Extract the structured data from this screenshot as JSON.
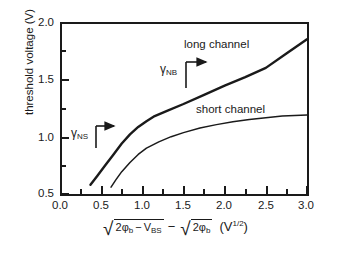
{
  "chart_data": {
    "type": "line",
    "title": "",
    "xlabel": "sqrt(2*phi_b - V_BS) - sqrt(2*phi_b)  (V^1/2)",
    "ylabel": "threshold voltage (V)",
    "xlim": [
      0.0,
      3.0
    ],
    "ylim": [
      0.5,
      2.0
    ],
    "x_major_step": 0.5,
    "x_minor_step": 0.25,
    "y_major_step": 0.5,
    "y_minor_step": 0.25,
    "grid": false,
    "legend": "inline-curve-labels",
    "x_ticklabels": [
      "0.0",
      "0.5",
      "1.0",
      "1.5",
      "2.0",
      "2.5",
      "3.0"
    ],
    "y_ticklabels": [
      "0.5",
      "1.0",
      "1.5",
      "2.0"
    ],
    "series": [
      {
        "name": "long channel",
        "x": [
          0.37,
          0.45,
          0.55,
          0.65,
          0.75,
          0.85,
          0.95,
          1.05,
          1.15,
          1.3,
          1.5,
          1.75,
          2.0,
          2.25,
          2.5,
          2.75,
          3.0
        ],
        "values": [
          0.58,
          0.655,
          0.75,
          0.845,
          0.94,
          1.02,
          1.085,
          1.135,
          1.18,
          1.225,
          1.285,
          1.365,
          1.445,
          1.52,
          1.6,
          1.725,
          1.85
        ]
      },
      {
        "name": "short channel",
        "x": [
          0.62,
          0.68,
          0.75,
          0.85,
          0.95,
          1.05,
          1.2,
          1.35,
          1.5,
          1.7,
          1.9,
          2.1,
          2.3,
          2.5,
          2.7,
          2.85,
          3.0
        ],
        "values": [
          0.56,
          0.625,
          0.695,
          0.775,
          0.845,
          0.9,
          0.955,
          1.0,
          1.035,
          1.075,
          1.105,
          1.13,
          1.15,
          1.165,
          1.18,
          1.185,
          1.19
        ]
      }
    ],
    "annotations": [
      {
        "name": "gamma-nb",
        "text": "γ",
        "subscript": "NB",
        "note": "slope of long-channel linear region"
      },
      {
        "name": "gamma-ns",
        "text": "γ",
        "subscript": "NS",
        "note": "slope of steep low-bias region"
      }
    ]
  },
  "axes": {
    "y_title": "threshold voltage (V)",
    "y_ticks": [
      {
        "value": 2.0,
        "label": "2.0"
      },
      {
        "value": 1.5,
        "label": "1.5"
      },
      {
        "value": 1.0,
        "label": "1.0"
      },
      {
        "value": 0.5,
        "label": "0.5"
      }
    ],
    "x_ticks": [
      {
        "value": 0.0,
        "label": "0.0"
      },
      {
        "value": 0.5,
        "label": "0.5"
      },
      {
        "value": 1.0,
        "label": "1.0"
      },
      {
        "value": 1.5,
        "label": "1.5"
      },
      {
        "value": 2.0,
        "label": "2.0"
      },
      {
        "value": 2.5,
        "label": "2.5"
      },
      {
        "value": 3.0,
        "label": "3.0"
      }
    ],
    "x_title_parts": {
      "radicand_1_a": "2φ",
      "radicand_1_a_sub": "b",
      "minus_inner": "−",
      "radicand_1_b": "V",
      "radicand_1_b_sub": "BS",
      "minus_outer": "−",
      "radicand_2": "2φ",
      "radicand_2_sub": "b",
      "units_open": "(",
      "units_v": "V",
      "units_exp": "1/2",
      "units_close": ")"
    }
  },
  "curve_labels": {
    "long": "long channel",
    "short": "short channel"
  },
  "gamma_labels": {
    "nb_symbol": "γ",
    "nb_sub": "NB",
    "ns_symbol": "γ",
    "ns_sub": "NS"
  },
  "colors": {
    "ink": "#1a1a1a",
    "background": "#ffffff"
  }
}
